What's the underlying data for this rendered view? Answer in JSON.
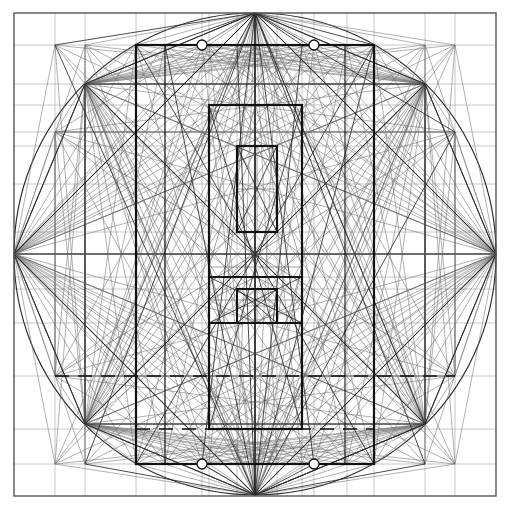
{
  "document": {
    "title": "Geometric Construction Diagram",
    "kind": "technical-line-drawing",
    "background_color": "#ffffff",
    "width": 509,
    "height": 511
  },
  "palette": {
    "ink_heavy": "#111111",
    "ink_medium": "#2b2b2b",
    "ink_light": "#6f6f6f",
    "ink_faint": "#9a9a9a",
    "frame": "#555555"
  },
  "geometry": {
    "center": {
      "x": 255,
      "y": 254
    },
    "circle_radius": 241,
    "frame_rect": {
      "x": 14,
      "y": 13,
      "w": 482,
      "h": 483
    },
    "circle_cardinal_points": [
      {
        "name": "top",
        "x": 255,
        "y": 13
      },
      {
        "name": "right",
        "x": 496,
        "y": 254
      },
      {
        "name": "bottom",
        "x": 255,
        "y": 495
      },
      {
        "name": "left",
        "x": 14,
        "y": 254
      }
    ],
    "octagon_points": [
      {
        "name": "n",
        "x": 255,
        "y": 13
      },
      {
        "name": "ne",
        "x": 425,
        "y": 84
      },
      {
        "name": "e",
        "x": 496,
        "y": 254
      },
      {
        "name": "se",
        "x": 425,
        "y": 424
      },
      {
        "name": "s",
        "x": 255,
        "y": 495
      },
      {
        "name": "sw",
        "x": 85,
        "y": 424
      },
      {
        "name": "w",
        "x": 14,
        "y": 254
      },
      {
        "name": "nw",
        "x": 85,
        "y": 84
      }
    ],
    "inner_octagon_points": [
      {
        "name": "nw",
        "x": 55,
        "y": 132
      },
      {
        "name": "ne",
        "x": 455,
        "y": 132
      },
      {
        "name": "se",
        "x": 455,
        "y": 376
      },
      {
        "name": "sw",
        "x": 55,
        "y": 376
      }
    ],
    "rect_outer": {
      "x": 136,
      "y": 45,
      "w": 238,
      "h": 419
    },
    "rect_second": {
      "x": 136,
      "y": 45,
      "w": 238,
      "h": 419
    },
    "rect_mid": {
      "x": 209,
      "y": 105,
      "w": 93,
      "h": 324
    },
    "rect_inner": {
      "x": 237,
      "y": 146,
      "w": 40,
      "h": 86
    },
    "rect_lower": {
      "x": 237,
      "y": 289,
      "w": 40,
      "h": 34
    },
    "rect_lower_wide": {
      "x": 209,
      "y": 277,
      "w": 93,
      "h": 46
    },
    "vertical_axis_x": 255,
    "horizontal_axis_y": 254,
    "dashed_row_y": 376,
    "dashed_row2_y": 429,
    "dashed_row3_y": 464,
    "marker_circles": [
      {
        "x": 202,
        "y": 45,
        "r": 5
      },
      {
        "x": 314,
        "y": 45,
        "r": 5
      },
      {
        "x": 202,
        "y": 464,
        "r": 5
      },
      {
        "x": 314,
        "y": 464,
        "r": 5
      }
    ],
    "guide_columns": [
      55,
      85,
      136,
      165,
      202,
      209,
      237,
      255,
      277,
      302,
      314,
      347,
      374,
      425,
      455
    ],
    "guide_rows": [
      45,
      84,
      105,
      132,
      146,
      184,
      232,
      254,
      277,
      289,
      323,
      376,
      429,
      464
    ]
  },
  "labels": {
    "none_visible": ""
  }
}
